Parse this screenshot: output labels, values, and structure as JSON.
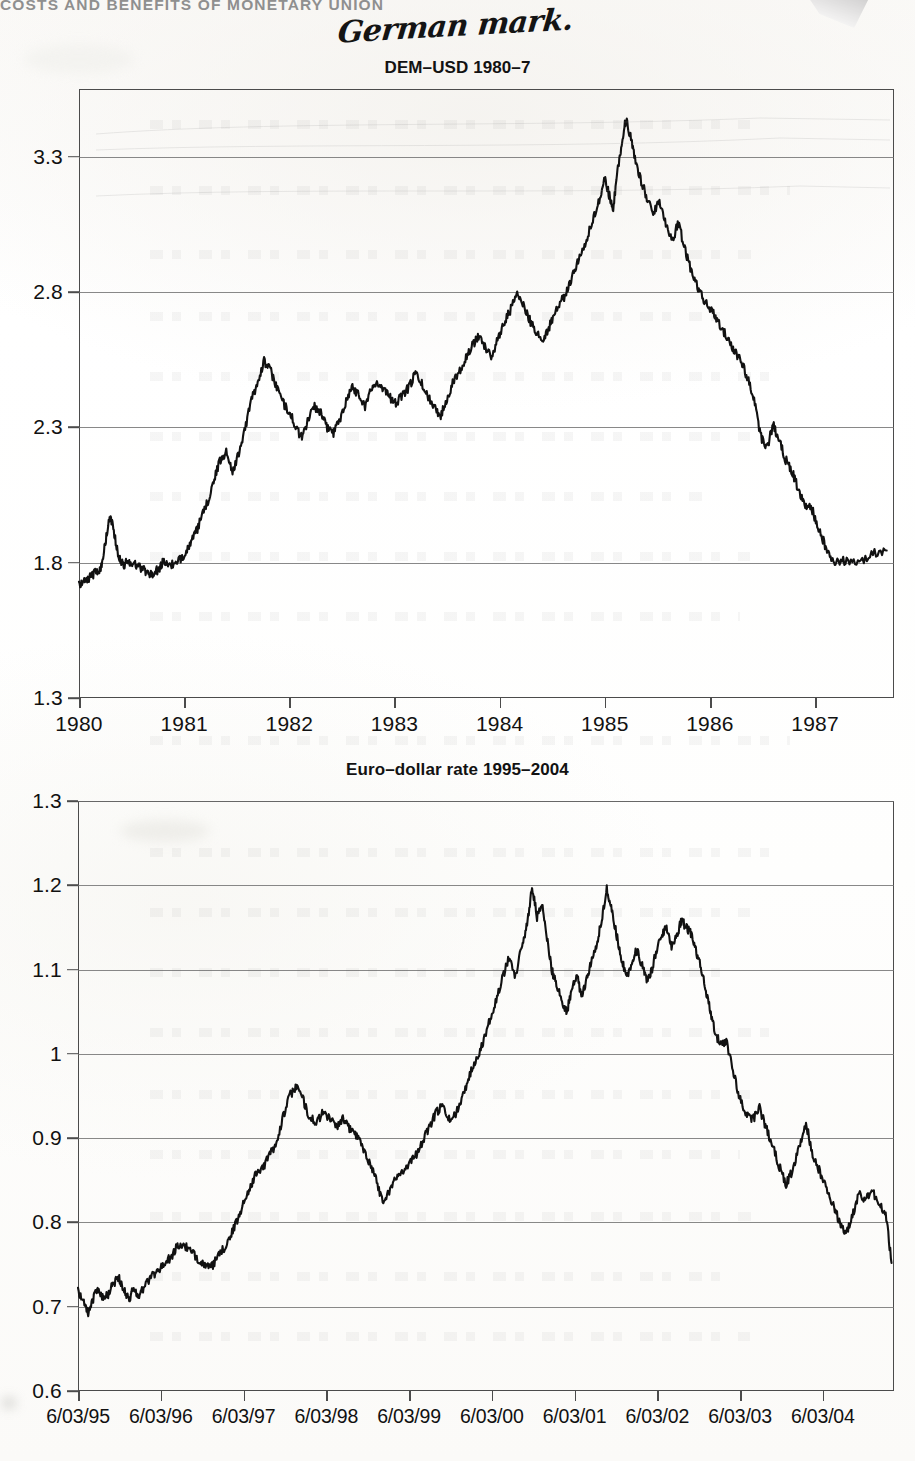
{
  "page": {
    "running_head": "COSTS AND BENEFITS OF MONETARY UNION",
    "handwritten_note": "German mark.",
    "background_color": "#fdfdfc",
    "ink_color": "#111111"
  },
  "charts": [
    {
      "id": "dem-usd",
      "title": "DEM–USD 1980–7",
      "ytick_labels": [
        "1.3",
        "1.8",
        "2.3",
        "2.8",
        "3.3"
      ],
      "xtick_labels": [
        "1980",
        "1981",
        "1982",
        "1983",
        "1984",
        "1985",
        "1986",
        "1987"
      ]
    },
    {
      "id": "eur-usd",
      "title": "Euro–dollar rate 1995–2004",
      "ytick_labels": [
        "0.6",
        "0.7",
        "0.8",
        "0.9",
        "1",
        "1.1",
        "1.2",
        "1.3"
      ],
      "xtick_labels": [
        "6/03/95",
        "6/03/96",
        "6/03/97",
        "6/03/98",
        "6/03/99",
        "6/03/00",
        "6/03/01",
        "6/03/02",
        "6/03/03",
        "6/03/04"
      ]
    }
  ],
  "chart_data": [
    {
      "type": "line",
      "title": "DEM–USD 1980–7",
      "xlabel": "",
      "ylabel": "",
      "xlim": [
        1980.0,
        1987.75
      ],
      "ylim": [
        1.3,
        3.55
      ],
      "yticks": [
        1.3,
        1.8,
        2.3,
        2.8,
        3.3
      ],
      "xticks": [
        1980,
        1981,
        1982,
        1983,
        1984,
        1985,
        1986,
        1987
      ],
      "grid": true,
      "legend": "none",
      "series": [
        {
          "name": "DEM per USD",
          "x": [
            1980.0,
            1980.05,
            1980.1,
            1980.14,
            1980.18,
            1980.22,
            1980.26,
            1980.3,
            1980.34,
            1980.38,
            1980.42,
            1980.46,
            1980.5,
            1980.55,
            1980.6,
            1980.65,
            1980.7,
            1980.75,
            1980.8,
            1980.86,
            1980.92,
            1980.98,
            1981.04,
            1981.1,
            1981.16,
            1981.22,
            1981.28,
            1981.34,
            1981.4,
            1981.46,
            1981.52,
            1981.58,
            1981.64,
            1981.7,
            1981.76,
            1981.82,
            1981.88,
            1981.94,
            1982.0,
            1982.06,
            1982.12,
            1982.18,
            1982.24,
            1982.3,
            1982.36,
            1982.42,
            1982.48,
            1982.54,
            1982.6,
            1982.66,
            1982.72,
            1982.78,
            1982.84,
            1982.9,
            1982.96,
            1983.02,
            1983.08,
            1983.14,
            1983.2,
            1983.26,
            1983.32,
            1983.38,
            1983.44,
            1983.5,
            1983.56,
            1983.62,
            1983.68,
            1983.74,
            1983.8,
            1983.86,
            1983.92,
            1983.98,
            1984.04,
            1984.1,
            1984.16,
            1984.22,
            1984.28,
            1984.34,
            1984.4,
            1984.46,
            1984.52,
            1984.58,
            1984.64,
            1984.7,
            1984.76,
            1984.82,
            1984.88,
            1984.94,
            1985.0,
            1985.04,
            1985.08,
            1985.12,
            1985.16,
            1985.2,
            1985.24,
            1985.28,
            1985.34,
            1985.4,
            1985.46,
            1985.52,
            1985.58,
            1985.64,
            1985.7,
            1985.76,
            1985.82,
            1985.88,
            1985.94,
            1986.0,
            1986.06,
            1986.12,
            1986.18,
            1986.24,
            1986.3,
            1986.36,
            1986.42,
            1986.48,
            1986.54,
            1986.6,
            1986.66,
            1986.72,
            1986.78,
            1986.84,
            1986.9,
            1986.96,
            1987.02,
            1987.08,
            1987.14,
            1987.2,
            1987.3,
            1987.42,
            1987.55,
            1987.68
          ],
          "y": [
            1.715,
            1.735,
            1.745,
            1.76,
            1.77,
            1.79,
            1.9,
            1.975,
            1.9,
            1.815,
            1.79,
            1.805,
            1.8,
            1.79,
            1.78,
            1.765,
            1.755,
            1.775,
            1.8,
            1.795,
            1.79,
            1.82,
            1.86,
            1.9,
            1.96,
            2.02,
            2.1,
            2.175,
            2.21,
            2.14,
            2.2,
            2.3,
            2.4,
            2.47,
            2.545,
            2.51,
            2.45,
            2.39,
            2.36,
            2.3,
            2.26,
            2.33,
            2.38,
            2.35,
            2.3,
            2.28,
            2.33,
            2.4,
            2.45,
            2.42,
            2.38,
            2.44,
            2.47,
            2.44,
            2.41,
            2.39,
            2.42,
            2.45,
            2.5,
            2.46,
            2.41,
            2.38,
            2.34,
            2.41,
            2.47,
            2.51,
            2.56,
            2.6,
            2.64,
            2.6,
            2.56,
            2.62,
            2.69,
            2.73,
            2.79,
            2.76,
            2.7,
            2.66,
            2.62,
            2.66,
            2.72,
            2.76,
            2.8,
            2.87,
            2.93,
            2.99,
            3.055,
            3.13,
            3.22,
            3.16,
            3.11,
            3.25,
            3.34,
            3.44,
            3.38,
            3.3,
            3.215,
            3.15,
            3.09,
            3.14,
            3.055,
            2.99,
            3.055,
            2.96,
            2.88,
            2.82,
            2.77,
            2.74,
            2.7,
            2.66,
            2.62,
            2.58,
            2.54,
            2.48,
            2.41,
            2.27,
            2.22,
            2.31,
            2.25,
            2.18,
            2.14,
            2.07,
            2.01,
            2.01,
            1.94,
            1.88,
            1.82,
            1.8,
            1.81,
            1.8,
            1.835,
            1.845
          ]
        }
      ]
    },
    {
      "type": "line",
      "title": "Euro–dollar rate 1995–2004",
      "xlabel": "",
      "ylabel": "",
      "xlim": [
        1995.17,
        2005.0
      ],
      "ylim": [
        0.6,
        1.3
      ],
      "yticks": [
        0.6,
        0.7,
        0.8,
        0.9,
        1.0,
        1.1,
        1.2,
        1.3
      ],
      "xticks": [
        "6/03/95",
        "6/03/96",
        "6/03/97",
        "6/03/98",
        "6/03/99",
        "6/03/00",
        "6/03/01",
        "6/03/02",
        "6/03/03",
        "6/03/04"
      ],
      "grid": true,
      "legend": "none",
      "series": [
        {
          "name": "USD per EUR (inverted presentation)",
          "x": [
            1995.17,
            1995.24,
            1995.3,
            1995.36,
            1995.42,
            1995.48,
            1995.54,
            1995.6,
            1995.66,
            1995.72,
            1995.78,
            1995.84,
            1995.9,
            1995.96,
            1996.04,
            1996.12,
            1996.2,
            1996.28,
            1996.36,
            1996.44,
            1996.52,
            1996.6,
            1996.68,
            1996.76,
            1996.84,
            1996.92,
            1997.0,
            1997.08,
            1997.16,
            1997.24,
            1997.32,
            1997.4,
            1997.48,
            1997.56,
            1997.64,
            1997.72,
            1997.8,
            1997.88,
            1997.96,
            1998.04,
            1998.12,
            1998.2,
            1998.28,
            1998.36,
            1998.44,
            1998.52,
            1998.6,
            1998.68,
            1998.76,
            1998.84,
            1998.92,
            1999.0,
            1999.08,
            1999.16,
            1999.24,
            1999.32,
            1999.4,
            1999.48,
            1999.56,
            1999.64,
            1999.72,
            1999.8,
            1999.88,
            1999.96,
            2000.04,
            2000.12,
            2000.2,
            2000.28,
            2000.36,
            2000.44,
            2000.52,
            2000.58,
            2000.64,
            2000.7,
            2000.76,
            2000.82,
            2000.88,
            2000.94,
            2001.0,
            2001.06,
            2001.12,
            2001.18,
            2001.24,
            2001.3,
            2001.36,
            2001.42,
            2001.48,
            2001.54,
            2001.6,
            2001.66,
            2001.72,
            2001.78,
            2001.84,
            2001.9,
            2001.96,
            2002.02,
            2002.08,
            2002.14,
            2002.2,
            2002.26,
            2002.32,
            2002.38,
            2002.44,
            2002.5,
            2002.56,
            2002.62,
            2002.68,
            2002.74,
            2002.8,
            2002.86,
            2002.92,
            2002.98,
            2003.06,
            2003.14,
            2003.22,
            2003.3,
            2003.38,
            2003.46,
            2003.54,
            2003.62,
            2003.7,
            2003.78,
            2003.86,
            2003.94,
            2004.02,
            2004.1,
            2004.18,
            2004.26,
            2004.34,
            2004.42,
            2004.5,
            2004.58,
            2004.66,
            2004.74,
            2004.82,
            2004.9,
            2004.97
          ],
          "y": [
            0.718,
            0.706,
            0.692,
            0.712,
            0.722,
            0.708,
            0.716,
            0.728,
            0.736,
            0.72,
            0.708,
            0.722,
            0.713,
            0.722,
            0.735,
            0.742,
            0.75,
            0.758,
            0.77,
            0.774,
            0.766,
            0.758,
            0.752,
            0.745,
            0.756,
            0.768,
            0.782,
            0.8,
            0.822,
            0.842,
            0.858,
            0.866,
            0.88,
            0.895,
            0.925,
            0.95,
            0.962,
            0.946,
            0.925,
            0.918,
            0.93,
            0.924,
            0.914,
            0.922,
            0.912,
            0.904,
            0.89,
            0.872,
            0.852,
            0.824,
            0.838,
            0.852,
            0.862,
            0.87,
            0.88,
            0.896,
            0.912,
            0.93,
            0.938,
            0.922,
            0.928,
            0.95,
            0.972,
            0.994,
            1.01,
            1.038,
            1.062,
            1.088,
            1.115,
            1.092,
            1.13,
            1.152,
            1.2,
            1.162,
            1.176,
            1.138,
            1.098,
            1.082,
            1.062,
            1.05,
            1.078,
            1.092,
            1.068,
            1.09,
            1.112,
            1.132,
            1.158,
            1.196,
            1.17,
            1.14,
            1.112,
            1.092,
            1.106,
            1.124,
            1.106,
            1.086,
            1.098,
            1.124,
            1.14,
            1.152,
            1.128,
            1.14,
            1.158,
            1.15,
            1.142,
            1.12,
            1.1,
            1.072,
            1.044,
            1.02,
            1.012,
            1.016,
            0.98,
            0.948,
            0.93,
            0.922,
            0.936,
            0.912,
            0.89,
            0.866,
            0.846,
            0.862,
            0.89,
            0.918,
            0.88,
            0.862,
            0.842,
            0.822,
            0.802,
            0.786,
            0.808,
            0.836,
            0.826,
            0.838,
            0.82,
            0.812,
            0.752
          ]
        }
      ]
    }
  ]
}
